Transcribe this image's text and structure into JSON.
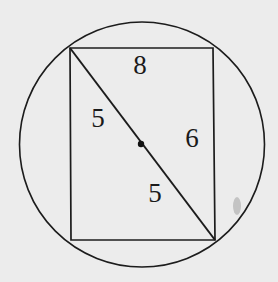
{
  "diagram": {
    "type": "geometry",
    "colors": {
      "background": "#ececec",
      "stroke": "#1c1c1c",
      "text": "#1a1a1a"
    },
    "circle": {
      "cx": 142,
      "cy": 144.5,
      "r": 122.5
    },
    "rectangle": {
      "corners": {
        "top_left": [
          70,
          48
        ],
        "top_right": [
          213,
          48
        ],
        "bottom_right": [
          215,
          240
        ],
        "bottom_left": [
          71,
          240
        ]
      }
    },
    "diagonal": {
      "from": [
        70,
        48
      ],
      "to": [
        215,
        240
      ]
    },
    "center_point": [
      141,
      144
    ],
    "labels": [
      {
        "id": "top-side",
        "text": "8",
        "x": 140,
        "y": 74
      },
      {
        "id": "diagonal-upper-half",
        "text": "5",
        "x": 98,
        "y": 127
      },
      {
        "id": "right-side",
        "text": "6",
        "x": 192,
        "y": 147
      },
      {
        "id": "diagonal-lower-half",
        "text": "5",
        "x": 155,
        "y": 202
      }
    ]
  }
}
